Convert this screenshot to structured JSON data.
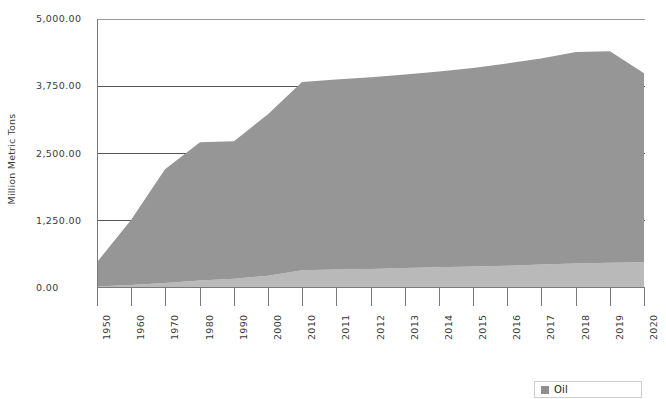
{
  "chart_data": {
    "type": "area",
    "title": "",
    "subtitle": "",
    "xlabel": "",
    "ylabel": "Million Metric Tons",
    "ylim": [
      0,
      5000
    ],
    "y_ticks": [
      0,
      1250,
      2500,
      3750,
      5000
    ],
    "y_tick_labels": [
      "0.00",
      "1,250.00",
      "2,500.00",
      "3,750.00",
      "5,000.00"
    ],
    "grid": true,
    "legend_position": "bottom-right",
    "legend_entries": [
      "Oil"
    ],
    "stacked": true,
    "categories": [
      "1950",
      "1960",
      "1970",
      "1980",
      "1990",
      "2000",
      "2010",
      "2011",
      "2012",
      "2013",
      "2014",
      "2015",
      "2016",
      "2017",
      "2018",
      "2019",
      "2020"
    ],
    "series": [
      {
        "name": "Oil (lower band)",
        "color": "#b9b9b9",
        "values": [
          30,
          55,
          95,
          140,
          170,
          230,
          330,
          345,
          355,
          370,
          385,
          400,
          415,
          435,
          455,
          470,
          480
        ]
      },
      {
        "name": "Oil (upper band)",
        "color": "#969696",
        "values": [
          450,
          1210,
          2110,
          2570,
          2560,
          3000,
          3500,
          3530,
          3560,
          3600,
          3640,
          3690,
          3760,
          3830,
          3930,
          3930,
          3510
        ]
      }
    ],
    "totals": [
      480,
      1265,
      2205,
      2710,
      2730,
      3230,
      3830,
      3875,
      3915,
      3970,
      4025,
      4090,
      4175,
      4265,
      4385,
      4400,
      3990
    ]
  },
  "axis": {
    "y_title": "Million Metric Tons"
  },
  "legend": {
    "items": [
      {
        "label": "Oil",
        "color": "#8f8f8f"
      }
    ]
  },
  "colors": {
    "band_upper": "#969696",
    "band_lower": "#b9b9b9",
    "gridline": "#555555",
    "axis": "#7a7a7a",
    "text": "#3a3a3a",
    "background": "#ffffff"
  }
}
